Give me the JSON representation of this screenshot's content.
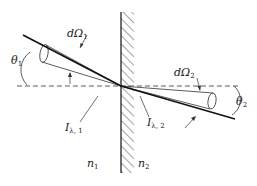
{
  "diagram": {
    "type": "refraction-radiation-geometry",
    "labels": {
      "solid_angle_1": "dΩ",
      "solid_angle_1_sub": "1",
      "solid_angle_2": "dΩ",
      "solid_angle_2_sub": "2",
      "theta_1": "θ",
      "theta_1_sub": "1",
      "theta_2": "θ",
      "theta_2_sub": "2",
      "intensity_1": "I",
      "intensity_1_sub": "λ, 1",
      "intensity_2": "I",
      "intensity_2_sub": "λ, 2",
      "medium_1": "n",
      "medium_1_sub": "1",
      "medium_2": "n",
      "medium_2_sub": "2"
    },
    "colors": {
      "stroke": "#222222",
      "background": "#ffffff"
    }
  }
}
